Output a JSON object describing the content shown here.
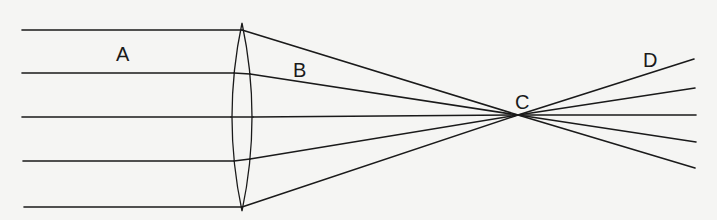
{
  "diagram": {
    "labels": {
      "A": "A",
      "B": "B",
      "C": "C",
      "D": "D"
    },
    "colors": {
      "background": "#f5f5f3",
      "line": "#1a1a1a"
    },
    "lens": {
      "type": "biconvex",
      "center_x": 242,
      "top_y": 24,
      "bottom_y": 210
    },
    "focal_point": {
      "x": 518,
      "y": 115
    },
    "rays": [
      {
        "start_y": 30,
        "lens_y": 30,
        "exit_y": 59
      },
      {
        "start_y": 73,
        "lens_y": 74,
        "exit_y": 88
      },
      {
        "start_y": 117,
        "lens_y": 117,
        "exit_y": 115
      },
      {
        "start_y": 161,
        "lens_y": 160,
        "exit_y": 142
      },
      {
        "start_y": 207,
        "lens_y": 206,
        "exit_y": 168
      }
    ]
  }
}
